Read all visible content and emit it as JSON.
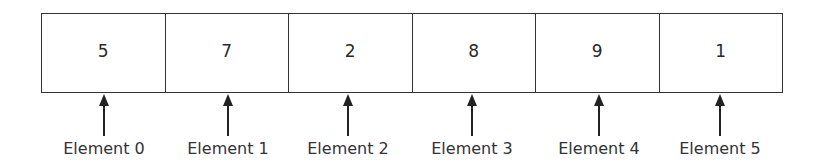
{
  "diagram": {
    "type": "array",
    "cells": [
      {
        "index": 0,
        "value": "5",
        "label": "Element 0"
      },
      {
        "index": 1,
        "value": "7",
        "label": "Element 1"
      },
      {
        "index": 2,
        "value": "2",
        "label": "Element 2"
      },
      {
        "index": 3,
        "value": "8",
        "label": "Element 3"
      },
      {
        "index": 4,
        "value": "9",
        "label": "Element 4"
      },
      {
        "index": 5,
        "value": "1",
        "label": "Element 5"
      }
    ]
  }
}
